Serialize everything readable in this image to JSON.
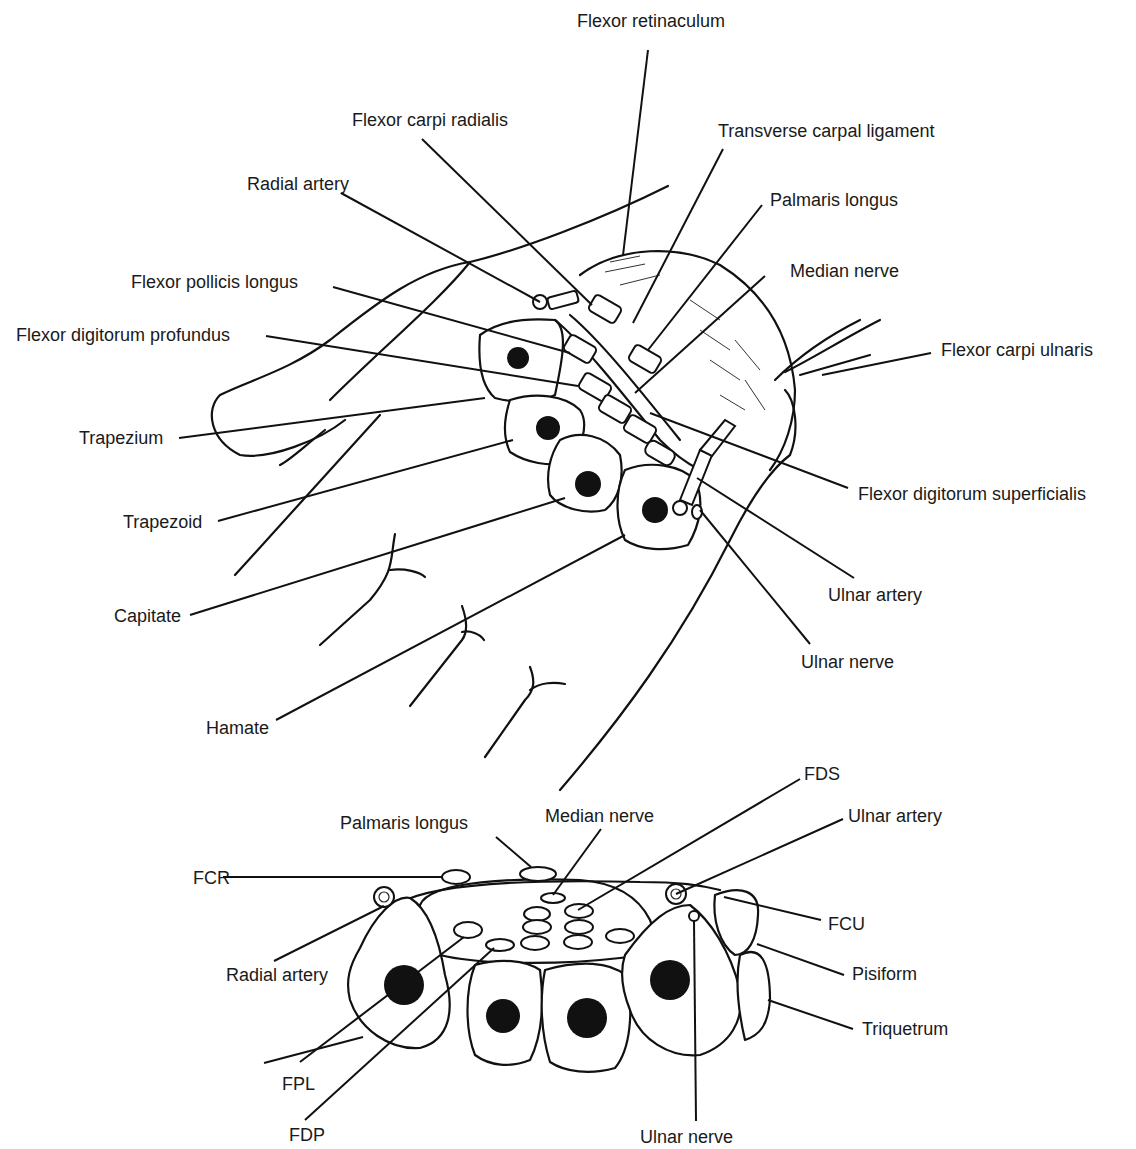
{
  "figure": {
    "top_view": {
      "labels": [
        {
          "id": "flexor-retinaculum",
          "text": "Flexor retinaculum"
        },
        {
          "id": "flexor-carpi-radialis",
          "text": "Flexor carpi radialis"
        },
        {
          "id": "transverse-carpal-ligament",
          "text": "Transverse carpal ligament"
        },
        {
          "id": "radial-artery",
          "text": "Radial artery"
        },
        {
          "id": "palmaris-longus",
          "text": "Palmaris longus"
        },
        {
          "id": "median-nerve",
          "text": "Median nerve"
        },
        {
          "id": "flexor-pollicis-longus",
          "text": "Flexor pollicis longus"
        },
        {
          "id": "flexor-digitorum-profundus",
          "text": "Flexor digitorum profundus"
        },
        {
          "id": "flexor-carpi-ulnaris",
          "text": "Flexor carpi ulnaris"
        },
        {
          "id": "trapezium",
          "text": "Trapezium"
        },
        {
          "id": "flexor-digitorum-superficialis",
          "text": "Flexor digitorum superficialis"
        },
        {
          "id": "trapezoid",
          "text": "Trapezoid"
        },
        {
          "id": "ulnar-artery",
          "text": "Ulnar artery"
        },
        {
          "id": "capitate",
          "text": "Capitate"
        },
        {
          "id": "ulnar-nerve",
          "text": "Ulnar nerve"
        },
        {
          "id": "hamate",
          "text": "Hamate"
        }
      ]
    },
    "cross_section": {
      "labels": [
        {
          "id": "fds",
          "text": "FDS"
        },
        {
          "id": "palmaris-longus",
          "text": "Palmaris longus"
        },
        {
          "id": "median-nerve",
          "text": "Median nerve"
        },
        {
          "id": "ulnar-artery",
          "text": "Ulnar artery"
        },
        {
          "id": "fcr",
          "text": "FCR"
        },
        {
          "id": "fcu",
          "text": "FCU"
        },
        {
          "id": "radial-artery",
          "text": "Radial artery"
        },
        {
          "id": "pisiform",
          "text": "Pisiform"
        },
        {
          "id": "triquetrum",
          "text": "Triquetrum"
        },
        {
          "id": "fpl",
          "text": "FPL"
        },
        {
          "id": "fdp",
          "text": "FDP"
        },
        {
          "id": "ulnar-nerve",
          "text": "Ulnar nerve"
        }
      ]
    },
    "colors": {
      "ink": "#111111",
      "background": "#ffffff"
    }
  }
}
